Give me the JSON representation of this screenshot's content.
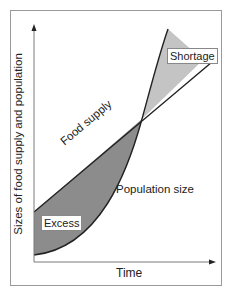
{
  "diagram": {
    "y_axis_label": "Sizes of food supply and population",
    "x_axis_label": "Time",
    "curves": {
      "food_supply": "Food supply",
      "population": "Population size"
    },
    "regions": {
      "excess": "Excess",
      "shortage": "Shortage"
    },
    "colors": {
      "excess_fill": "#8c8c8c",
      "shortage_fill": "#c4c4c4",
      "line": "#222222",
      "axis": "#7a7a7a"
    }
  }
}
